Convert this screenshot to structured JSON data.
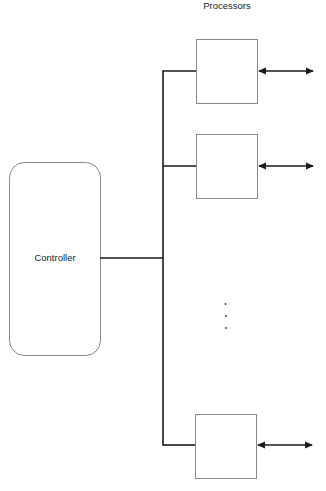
{
  "title": "Processors",
  "controller": {
    "label": "Controller"
  },
  "processors": [
    {
      "label": "",
      "y": 39
    },
    {
      "label": "",
      "y": 134
    },
    {
      "label": "",
      "y": 414
    }
  ],
  "ellipsis": "⋮",
  "colors": {
    "line": "#1a1a1a",
    "box": "#888888",
    "background": "#ffffff"
  }
}
